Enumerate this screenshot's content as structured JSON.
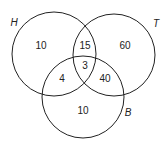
{
  "sets": [
    {
      "id": "H",
      "label": "H"
    },
    {
      "id": "T",
      "label": "T"
    },
    {
      "id": "B",
      "label": "B"
    }
  ],
  "regions": {
    "H_only": "10",
    "T_only": "60",
    "B_only": "10",
    "H_T": "15",
    "H_B": "4",
    "T_B": "40",
    "H_T_B": "3"
  }
}
